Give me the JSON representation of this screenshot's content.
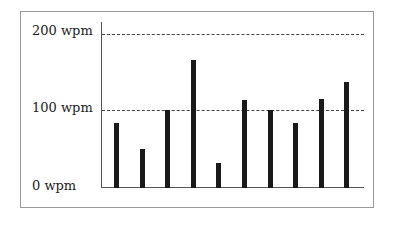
{
  "chart_data": {
    "type": "bar",
    "title": "",
    "xlabel": "",
    "ylabel": "",
    "categories": [
      "1",
      "2",
      "3",
      "4",
      "5",
      "6",
      "7",
      "8",
      "9",
      "10"
    ],
    "values": [
      84,
      50,
      101,
      166,
      32,
      114,
      101,
      84,
      116,
      138
    ],
    "ylim": [
      0,
      200
    ],
    "yticks": [
      0,
      100,
      200
    ],
    "ytick_labels": [
      "0 wpm",
      "100 wpm",
      "200 wpm"
    ],
    "grid": "horizontal dashed at 100 and 200",
    "legend": null,
    "bar_color": "#1a1a1a"
  },
  "axis": {
    "label_200": "200 wpm",
    "label_100": "100 wpm",
    "label_0": "0 wpm"
  }
}
